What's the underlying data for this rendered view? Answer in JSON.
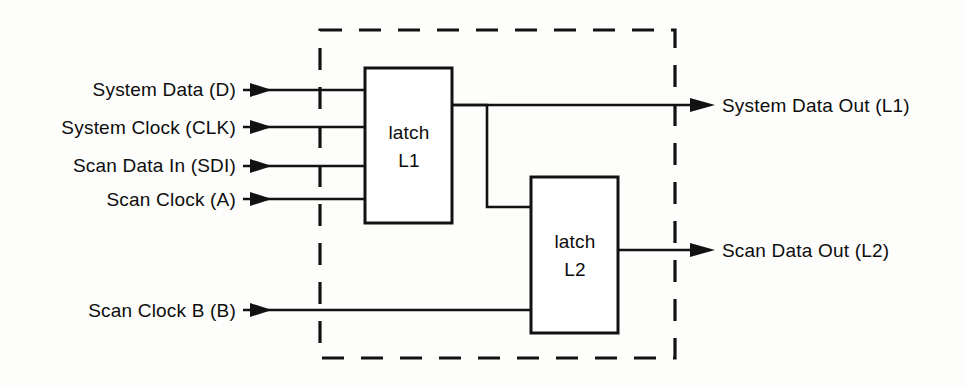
{
  "diagram": {
    "colors": {
      "background": "#fdfdfb",
      "line": "#121212",
      "box_fill": "#ffffff"
    },
    "inputs": [
      {
        "id": "d",
        "label": "System Data (D)",
        "target": "L1"
      },
      {
        "id": "clk",
        "label": "System Clock (CLK)",
        "target": "L1"
      },
      {
        "id": "sdi",
        "label": "Scan Data In (SDI)",
        "target": "L1"
      },
      {
        "id": "a",
        "label": "Scan Clock (A)",
        "target": "L1"
      },
      {
        "id": "b",
        "label": "Scan Clock B (B)",
        "target": "L2"
      }
    ],
    "outputs": [
      {
        "id": "l1out",
        "label": "System Data Out (L1)",
        "source": "L1"
      },
      {
        "id": "l2out",
        "label": "Scan Data Out (L2)",
        "source": "L2"
      }
    ],
    "blocks": [
      {
        "id": "L1",
        "line1": "latch",
        "line2": "L1"
      },
      {
        "id": "L2",
        "line1": "latch",
        "line2": "L2"
      }
    ],
    "boundary": {
      "style": "dashed",
      "label": ""
    }
  }
}
